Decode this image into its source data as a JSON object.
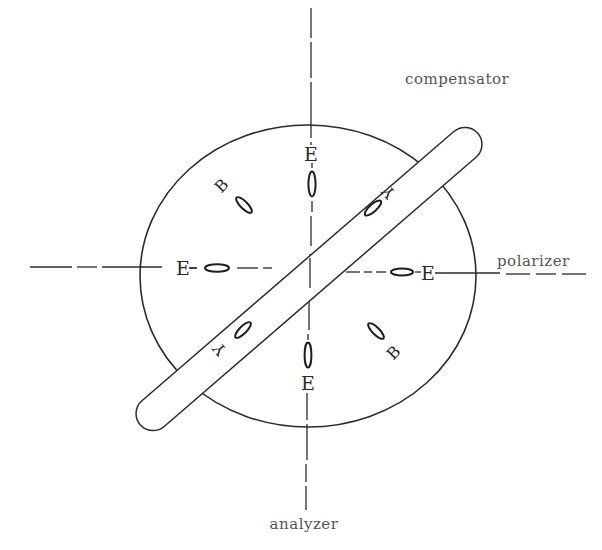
{
  "diagram": {
    "type": "optical-indicatrix-sketch",
    "labels": {
      "compensator": "compensator",
      "polarizer": "polarizer",
      "analyzer": "analyzer"
    },
    "positions": {
      "top": {
        "letter": "E"
      },
      "bottom": {
        "letter": "E"
      },
      "left": {
        "letter": "E"
      },
      "right": {
        "letter": "E"
      },
      "upper_left": {
        "letter": "B"
      },
      "lower_right": {
        "letter": "B"
      },
      "upper_right": {
        "letter": "Y"
      },
      "lower_left": {
        "letter": "Y"
      }
    },
    "colors": {
      "stroke": "#2b2b2b",
      "background": "#ffffff"
    }
  }
}
